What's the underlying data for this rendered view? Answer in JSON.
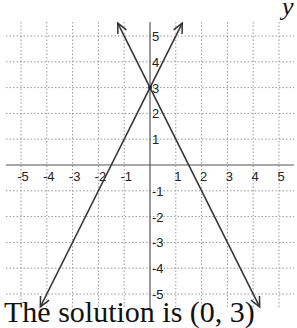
{
  "chart_data": {
    "type": "line",
    "title": "",
    "xlabel": "",
    "ylabel": "y",
    "xlim": [
      -5,
      5
    ],
    "ylim": [
      -5,
      5
    ],
    "grid": true,
    "x_ticks": [
      "-5",
      "-4",
      "-3",
      "-2",
      "-1",
      "1",
      "2",
      "3",
      "4",
      "5"
    ],
    "y_ticks": [
      "5",
      "4",
      "3",
      "2",
      "1",
      "-1",
      "-2",
      "-3",
      "-4",
      "-5"
    ],
    "series": [
      {
        "name": "line-1",
        "equation": "y = 2x + 3",
        "slope": 2,
        "intercept": 3,
        "x": [
          -4.25,
          1.25
        ],
        "y": [
          -5.5,
          5.5
        ]
      },
      {
        "name": "line-2",
        "equation": "y = -2x + 3",
        "slope": -2,
        "intercept": 3,
        "x": [
          -1.25,
          4.25
        ],
        "y": [
          5.5,
          -5.5
        ]
      }
    ],
    "intersection": [
      0,
      3
    ],
    "annotation": "The solution is (0, 3)"
  },
  "labels": {
    "y_axis": "y",
    "caption": "The solution is (0, 3)"
  }
}
